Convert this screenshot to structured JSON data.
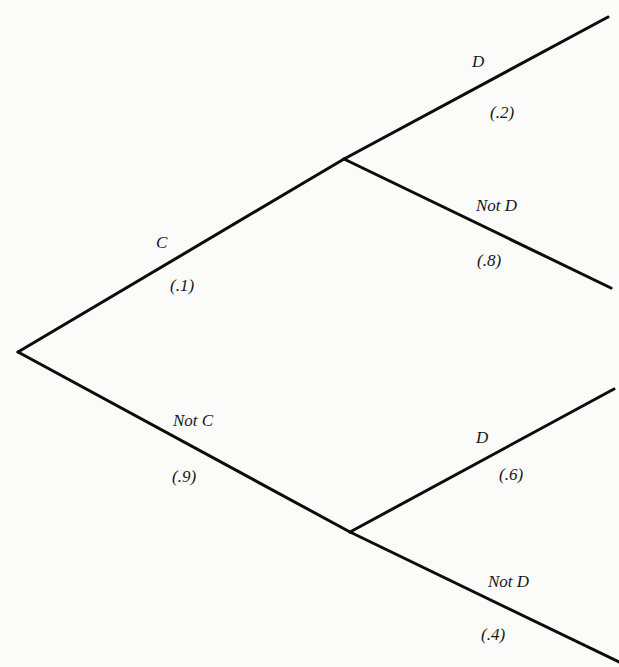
{
  "diagram": {
    "type": "probability-tree",
    "root": {
      "branches": [
        {
          "event": "C",
          "probability": "(.1)",
          "children": [
            {
              "event": "D",
              "probability": "(.2)"
            },
            {
              "event": "Not D",
              "probability": "(.8)"
            }
          ]
        },
        {
          "event": "Not C",
          "probability": "(.9)",
          "children": [
            {
              "event": "D",
              "probability": "(.6)"
            },
            {
              "event": "Not D",
              "probability": "(.4)"
            }
          ]
        }
      ]
    },
    "line_color": "#0c0c0c",
    "background_color": "#fbfbf9"
  }
}
